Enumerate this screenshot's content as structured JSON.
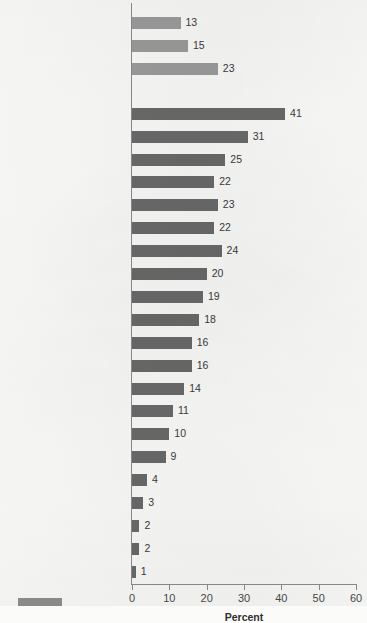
{
  "chart_data": {
    "type": "bar",
    "orientation": "horizontal",
    "title": "",
    "xlabel": "Percent",
    "ylabel": "",
    "xlim": [
      0,
      60
    ],
    "xticks": [
      0,
      10,
      20,
      30,
      40,
      50,
      60
    ],
    "grid": false,
    "legend_position": "bottom-left",
    "series": [
      {
        "name": "summary",
        "color": "#9c9c9c",
        "categories": [
          "All arrests",
          "Violent Crime Index",
          "Property Crime Index"
        ],
        "values": [
          13,
          15,
          23
        ]
      },
      {
        "name": "offense",
        "color": "#6a6a6a",
        "categories": [
          "Arson",
          "Vandalism",
          "Disorderly conduct",
          "Motor vehicle theft",
          "Burglary",
          "Larceny–theft",
          "Robbery",
          "Weapons",
          "Liquor laws",
          "Sex offense",
          "Other assaults",
          "Stolen property",
          "Forcible rape",
          "Aggravated assault",
          "Drug abuse",
          "Murder",
          "Offenses against the family",
          "Fraud",
          "Drunkenness",
          "Prostitution",
          "Driving under the influence"
        ],
        "values": [
          41,
          31,
          25,
          22,
          23,
          22,
          24,
          20,
          19,
          18,
          16,
          16,
          14,
          11,
          10,
          9,
          4,
          3,
          2,
          2,
          1
        ]
      }
    ],
    "legend": [
      {
        "label": "",
        "color": "#8f8f8f"
      }
    ]
  }
}
